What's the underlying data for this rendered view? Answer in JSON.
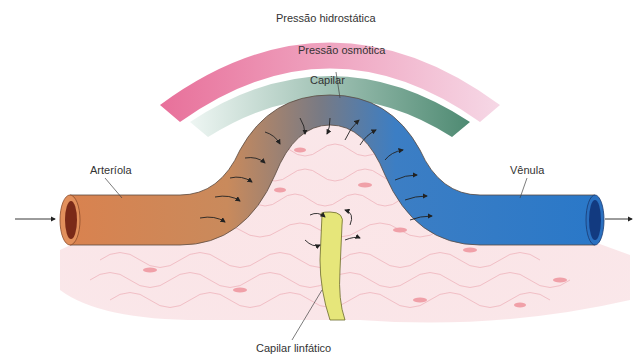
{
  "diagram": {
    "labels": {
      "hydrostatic": "Pressão hidrostática",
      "osmotic": "Pressão osmótica",
      "capillary": "Capilar",
      "arteriole": "Arteríola",
      "venule": "Vênula",
      "lymphatic": "Capilar linfático"
    },
    "colors": {
      "hydrostatic_start": "#e8709a",
      "hydrostatic_end": "#f6d8e6",
      "osmotic_start": "#e6f2ee",
      "osmotic_end": "#4e8a72",
      "arteriole": "#d9824f",
      "venule": "#2a78c8",
      "lymphatic": "#e6e67a",
      "tissue": "#f7d8dc"
    }
  }
}
